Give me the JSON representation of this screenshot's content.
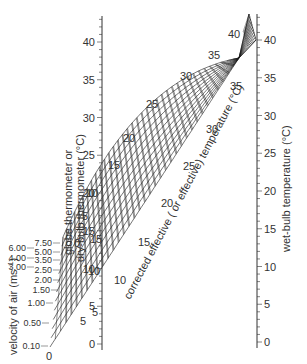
{
  "chart_data": {
    "type": "nomogram",
    "title": "",
    "left_axis": {
      "label_line1": "globe thermometer or",
      "label_line2": "dry-bulb thermometer (°C)",
      "range": [
        0,
        43
      ],
      "ticks": [
        0,
        5,
        10,
        15,
        20,
        25,
        30,
        35,
        40
      ]
    },
    "right_axis": {
      "label": "wet-bulb temperature (°C)",
      "range": [
        0,
        43
      ],
      "ticks": [
        0,
        5,
        10,
        15,
        20,
        25,
        30,
        35,
        40
      ]
    },
    "diagonal_label": "corrected effective ( or effective) temperature (°C)",
    "velocity_axis": {
      "label": "velocity of air (ms⁻¹)",
      "values": [
        "0.10",
        "0.50",
        "1.00",
        "1.50",
        "2.00",
        "2.50",
        "3.00",
        "3.50",
        "4.00",
        "5.00",
        "6.00",
        "7.50"
      ]
    },
    "cet_labels_upper": [
      "0",
      "5",
      "10",
      "15",
      "20",
      "25",
      "30",
      "35",
      "40"
    ],
    "cet_labels_lower": [
      "0",
      "5",
      "10",
      "15",
      "20",
      "25",
      "30",
      "35"
    ],
    "inner_labels": [
      "5",
      "10",
      "15"
    ]
  },
  "labels": {
    "left_title_1": "globe thermometer or",
    "left_title_2": "dry-bulb thermometer (°C)",
    "right_title": "wet-bulb temperature (°C)",
    "diag_title": "corrected effective ( or effective) temperature (°C)",
    "velocity_title": "velocity of air (ms",
    "velocity_sup": "−1",
    "velocity_close": ")"
  },
  "colors": {
    "line": "#1a1a1a",
    "text": "#333333",
    "axis": "#333333"
  }
}
